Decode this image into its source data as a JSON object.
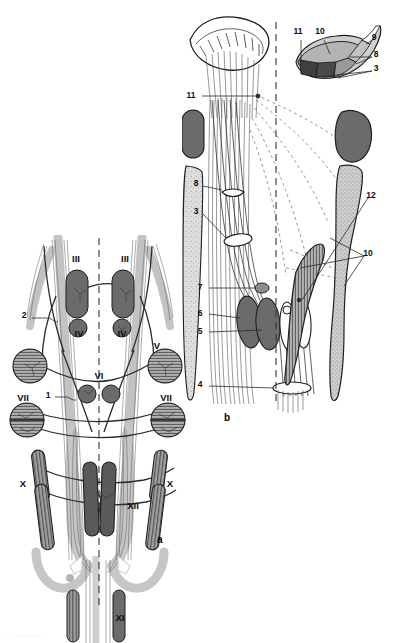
{
  "figure": {
    "panels": [
      {
        "id": "a",
        "label": "a",
        "caption": "dorsal view of brainstem nuclei"
      },
      {
        "id": "b",
        "label": "b",
        "caption": "lateral/oblique view of nuclei and fibre bundles"
      }
    ]
  },
  "panel_a": {
    "label": "a",
    "roman_labels": [
      {
        "text": "III",
        "x": 76,
        "y": 262
      },
      {
        "text": "III",
        "x": 125,
        "y": 262
      },
      {
        "text": "IV",
        "x": 79,
        "y": 337
      },
      {
        "text": "IV",
        "x": 122,
        "y": 337
      },
      {
        "text": "V",
        "x": 157,
        "y": 349
      },
      {
        "text": "VI",
        "x": 99,
        "y": 379
      },
      {
        "text": "VII",
        "x": 23,
        "y": 401
      },
      {
        "text": "VII",
        "x": 166,
        "y": 401
      },
      {
        "text": "X",
        "x": 23,
        "y": 487
      },
      {
        "text": "X",
        "x": 170,
        "y": 487
      },
      {
        "text": "XII",
        "x": 133,
        "y": 509
      },
      {
        "text": "XI",
        "x": 120,
        "y": 621
      }
    ],
    "number_labels": [
      {
        "text": "2",
        "x": 24,
        "y": 318
      },
      {
        "text": "1",
        "x": 48,
        "y": 398
      }
    ]
  },
  "panel_b": {
    "label": "b",
    "number_labels": [
      {
        "text": "11",
        "x": 191,
        "y": 98
      },
      {
        "text": "8",
        "x": 196,
        "y": 186
      },
      {
        "text": "3",
        "x": 196,
        "y": 214
      },
      {
        "text": "7",
        "x": 200,
        "y": 290
      },
      {
        "text": "6",
        "x": 200,
        "y": 316
      },
      {
        "text": "5",
        "x": 200,
        "y": 334
      },
      {
        "text": "4",
        "x": 200,
        "y": 387
      },
      {
        "text": "12",
        "x": 371,
        "y": 198
      },
      {
        "text": "10",
        "x": 368,
        "y": 256
      }
    ]
  },
  "panel_b_inset": {
    "number_labels": [
      {
        "text": "11",
        "x": 298,
        "y": 34
      },
      {
        "text": "10",
        "x": 320,
        "y": 34
      },
      {
        "text": "9",
        "x": 374,
        "y": 40
      },
      {
        "text": "8",
        "x": 376,
        "y": 57
      },
      {
        "text": "3",
        "x": 376,
        "y": 71
      }
    ]
  },
  "colors": {
    "nucleus_dark": "#6b6b6b",
    "nucleus_darker": "#5a5a5a",
    "nucleus_mid": "#8d8d8d",
    "hatch_fill": "#a8a8a8",
    "tract_gray": "#bdbdbd",
    "stipple": "#d4d4d4",
    "outline": "#1f1f1f",
    "midline_dash": "#333333",
    "background": "#ffffff"
  }
}
